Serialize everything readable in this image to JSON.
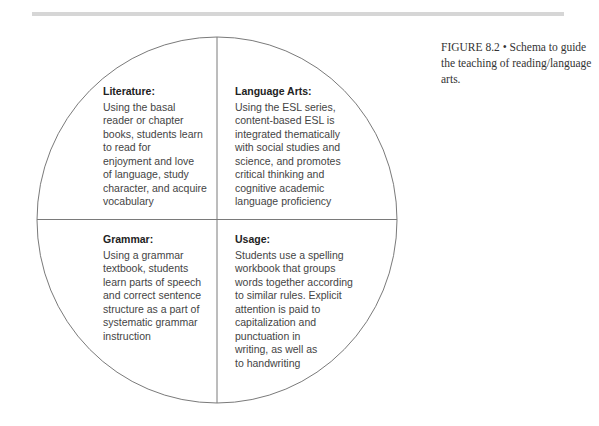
{
  "figure": {
    "label": "FIGURE 8.2",
    "separator": "•",
    "caption": "FIGURE 8.2  •  Schema to guide the teaching of reading/language arts."
  },
  "diagram": {
    "shape": "circle divided into four quadrants",
    "colors": {
      "line": "#7a7a7a",
      "text": "#444444",
      "title": "#222222",
      "rule": "#d6d6d6"
    },
    "quadrants": [
      {
        "position": "top-left",
        "title": "Literature:",
        "body": "Using the basal\nreader or chapter\nbooks, students learn\nto read for\nenjoyment and love\nof language, study\ncharacter, and acquire\nvocabulary"
      },
      {
        "position": "top-right",
        "title": "Language Arts:",
        "body": "Using the ESL series,\ncontent-based ESL is\nintegrated thematically\nwith social studies and\nscience, and promotes\ncritical thinking and\ncognitive academic\nlanguage proficiency"
      },
      {
        "position": "bottom-left",
        "title": "Grammar:",
        "body": "Using a grammar\ntextbook, students\nlearn parts of speech\nand correct sentence\nstructure as a part of\nsystematic grammar\ninstruction"
      },
      {
        "position": "bottom-right",
        "title": "Usage:",
        "body": "Students use a spelling\nworkbook that groups\nwords together according\nto similar rules. Explicit\nattention is paid to\ncapitalization and\npunctuation in\nwriting, as well as\nto handwriting"
      }
    ]
  }
}
